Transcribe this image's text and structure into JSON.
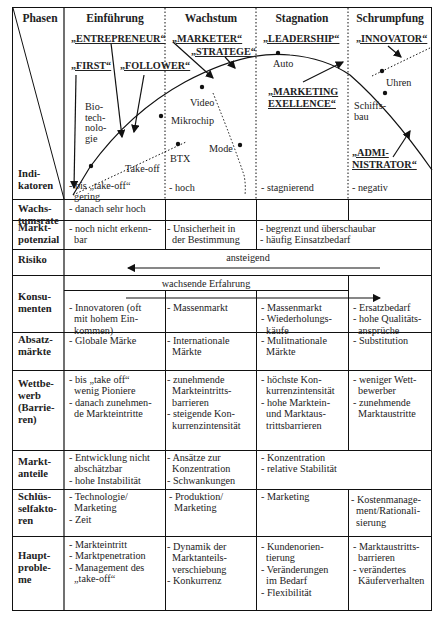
{
  "header": {
    "phases_label": "Phasen",
    "indicators_label": "Indi-\nkatoren",
    "phases": [
      "Einführung",
      "Wachstum",
      "Stagnation",
      "Schrumpfung"
    ]
  },
  "chart": {
    "roles": {
      "entrepreneur": "„ENTREPRENEUR“",
      "first": "„FIRST“",
      "follower": "„FOLLOWER“",
      "marketer": "„MARKETER“",
      "stratege": "„STRATEGE“",
      "leadership": "„LEADERSHIP“",
      "marketing_excellence": "„MARKETING\nEXELLENCE“",
      "innovator": "„INNOVATOR“",
      "administrator": "„ADMI-\nNISTRATOR“"
    },
    "products": {
      "biotech": "Bio-\ntech-\nnolo-\ngie",
      "take_off": "Take-off",
      "video": "Video",
      "mikrochip": "Mikrochip",
      "btx": "BTX",
      "mode": "Mode",
      "auto": "Auto",
      "uhren": "Uhren",
      "schiffsbau": "Schiffs-\nbau"
    }
  },
  "rows": [
    {
      "label": "Wachs-\ntumsrate",
      "cells": [
        "- bis „take-off“\n  gering\n- danach sehr hoch",
        "- hoch",
        "- stagnierend",
        "- negativ"
      ]
    },
    {
      "label": "Markt-\npotenzial",
      "cells": [
        "- noch nicht erkenn-\n  bar",
        "- Unsicherheit in\n  der Bestimmung",
        "- begrenzt und überschaubar\n- häufig Einsatzbedarf"
      ]
    },
    {
      "label": "Risiko",
      "arrow_text": "ansteigend"
    },
    {
      "label": "Konsu-\nmenten",
      "arrow_text": "wachsende Erfahrung",
      "cells": [
        "- Innovatoren (oft\n  mit hohem Ein-\n  kommen)",
        "- Massenmarkt",
        "- Massenmarkt\n- Wiederholungs-\n  käufe",
        "- Ersatzbedarf\n- hohe Qualitäts-\n  ansprüche"
      ]
    },
    {
      "label": "Absatz-\nmärkte",
      "cells": [
        "- Globale Märke",
        "- Internationale\n  Märkte",
        "- Mulitnationale\n  Märkte",
        "- Substitution"
      ]
    },
    {
      "label": "Wettbe-\nwerb\n(Barrie-\nren)",
      "cells": [
        "- bis „take off“\n  wenig Pioniere\n- danach zunehmen-\n  de Markteintritte",
        "- zunehmende\n  Markteintritts-\n  barrieren\n- steigende Kon-\n  kurrenzintensität",
        "- höchste Kon-\n  kurrenzintensität\n- hohe Marktein-\n  und Marktaus-\n  trittsbarrieren",
        "- weniger Wett-\n  bewerber\n- zunehmende\n  Marktaustritte"
      ]
    },
    {
      "label": "Markt-\nanteile",
      "cells": [
        "- Entwicklung nicht\n  abschätzbar\n- hohe Instabilität",
        "- Ansätze zur\n  Konzentration\n- Schwankungen",
        "- Konzentration\n- relative Stabilität"
      ]
    },
    {
      "label": "Schlüs-\nselfakto-\nren",
      "cells": [
        "- Technologie/\n  Marketing\n- Zeit",
        "- Produktion/\n  Marketing",
        "- Marketing",
        "- Kostenmanage-\n  ment/Rationali-\n  sierung"
      ]
    },
    {
      "label": "Haupt-\nproble-\nme",
      "cells": [
        "- Markteintritt\n- Marktpenetration\n- Management des\n  „take-off“",
        "- Dynamik der\n  Marktanteils-\n  verschiebung\n- Konkurrenz",
        "- Kundenorien-\n  tierung\n- Veränderungen\n  im Bedarf\n- Flexibilität",
        "- Marktaustritts-\n  barrieren\n- verändertes\n  Käuferverhalten"
      ]
    }
  ]
}
